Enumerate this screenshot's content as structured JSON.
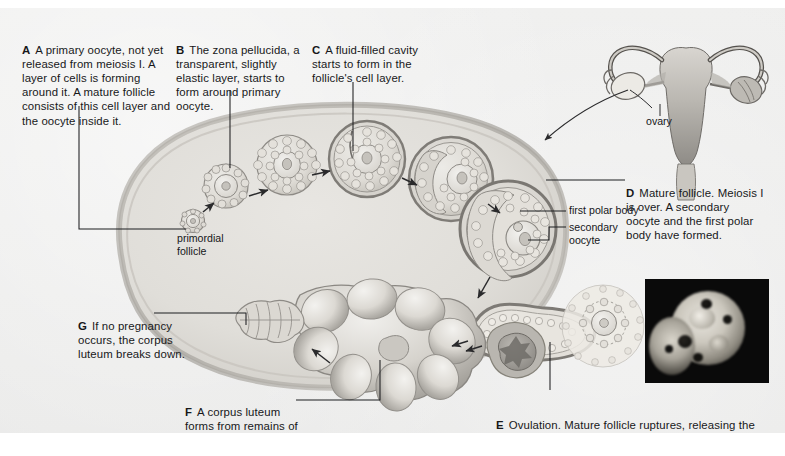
{
  "figure": {
    "background_color": "#ececeb",
    "text_color": "#17181a"
  },
  "captions": [
    {
      "letter": "A",
      "text": "A primary oocyte, not yet released from meiosis I. A layer of cells is forming around it. A mature follicle consists of this cell layer and the oocyte inside it."
    },
    {
      "letter": "B",
      "text": "The zona pellucida, a transparent, slightly elastic layer, starts to form around primary oocyte."
    },
    {
      "letter": "C",
      "text": "A fluid-filled cavity starts to form in the follicle's cell layer."
    },
    {
      "letter": "D",
      "text": "Mature follicle. Meiosis I is over. A secondary oocyte and the first polar body have formed."
    },
    {
      "letter": "E",
      "text": "Ovulation. Mature follicle ruptures, releasing the secondary oocyte and first polar body."
    },
    {
      "letter": "F",
      "text": "A corpus luteum forms from remains of ruptured follicle."
    },
    {
      "letter": "G",
      "text": "If no pregnancy occurs, the corpus luteum breaks down."
    }
  ],
  "inline_labels": [
    {
      "name": "primordial-follicle",
      "text": "primordial\nfollicle"
    },
    {
      "name": "first-polar-body",
      "text": "first polar body"
    },
    {
      "name": "secondary-oocyte",
      "text": "secondary\noocyte"
    },
    {
      "name": "ovary",
      "text": "ovary"
    }
  ],
  "illustration": {
    "ovary_label": "ovary",
    "stages": [
      "primordial follicle",
      "primary follicle",
      "growing follicle",
      "secondary follicle with antrum",
      "late secondary follicle",
      "mature (Graafian) follicle",
      "ovulating follicle",
      "corpus luteum",
      "degenerating corpus luteum",
      "corpus albicans"
    ]
  },
  "inset_photo": {
    "name": "ovulation-micrograph",
    "caption": "",
    "background_color": "#0a0a0a"
  }
}
